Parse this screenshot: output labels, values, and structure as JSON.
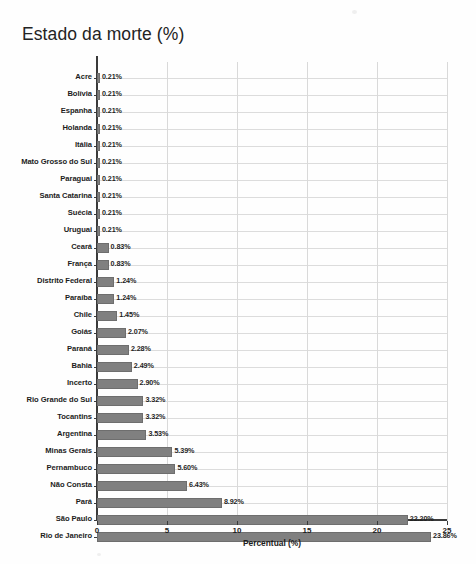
{
  "chart_data": {
    "type": "bar",
    "orientation": "horizontal",
    "title": "Estado da morte (%)",
    "xlabel": "Percentual (%)",
    "ylabel": "",
    "xlim": [
      0,
      25
    ],
    "xticks": [
      "0",
      "5",
      "10",
      "15",
      "20",
      "25"
    ],
    "grid": true,
    "legend": null,
    "bar_color": "#808080",
    "categories": [
      "Acre",
      "Bolívia",
      "Espanha",
      "Holanda",
      "Itália",
      "Mato Grosso do Sul",
      "Paraguai",
      "Santa Catarina",
      "Suécia",
      "Uruguai",
      "Ceará",
      "França",
      "Distrito Federal",
      "Paraíba",
      "Chile",
      "Goiás",
      "Paraná",
      "Bahia",
      "Incerto",
      "Rio Grande do Sul",
      "Tocantins",
      "Argentina",
      "Minas Gerais",
      "Pernambuco",
      "Não Consta",
      "Pará",
      "São Paulo",
      "Rio de Janeiro"
    ],
    "values": [
      0.21,
      0.21,
      0.21,
      0.21,
      0.21,
      0.21,
      0.21,
      0.21,
      0.21,
      0.21,
      0.83,
      0.83,
      1.24,
      1.24,
      1.45,
      2.07,
      2.28,
      2.49,
      2.9,
      3.32,
      3.32,
      3.53,
      5.39,
      5.6,
      6.43,
      8.92,
      22.2,
      23.86
    ],
    "value_labels": [
      "0.21%",
      "0.21%",
      "0.21%",
      "0.21%",
      "0.21%",
      "0.21%",
      "0.21%",
      "0.21%",
      "0.21%",
      "0.21%",
      "0.83%",
      "0.83%",
      "1.24%",
      "1.24%",
      "1.45%",
      "2.07%",
      "2.28%",
      "2.49%",
      "2.90%",
      "3.32%",
      "3.32%",
      "3.53%",
      "5.39%",
      "5.60%",
      "6.43%",
      "8.92%",
      "22.20%",
      "23.86%"
    ]
  }
}
